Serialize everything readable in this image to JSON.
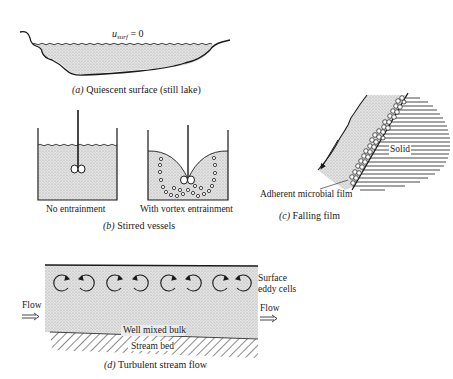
{
  "panels": {
    "a": {
      "equation_var": "u",
      "equation_sub": "surf",
      "equation_rhs": " = 0",
      "caption_letter": "(a)",
      "caption_text": " Quiescent surface (still lake)"
    },
    "b": {
      "left_label": "No entrainment",
      "right_label": "With vortex entrainment",
      "caption_letter": "(b)",
      "caption_text": " Stirred vessels"
    },
    "c": {
      "solid_label": "Solid",
      "film_label": "Adherent microbial film",
      "caption_letter": "(c)",
      "caption_text": " Falling film"
    },
    "d": {
      "eddy_label_line1": "Surface",
      "eddy_label_line2": "eddy cells",
      "flow_in_label": "Flow",
      "flow_out_label": "Flow",
      "bulk_label": "Well mixed bulk",
      "bed_label": "Stream bed",
      "caption_letter": "(d)",
      "caption_text": " Turbulent stream flow",
      "eddy_count": 8
    }
  },
  "colors": {
    "ink": "#1a1a1a",
    "fluid_fill": "#d9d9d9",
    "background": "#ffffff"
  }
}
